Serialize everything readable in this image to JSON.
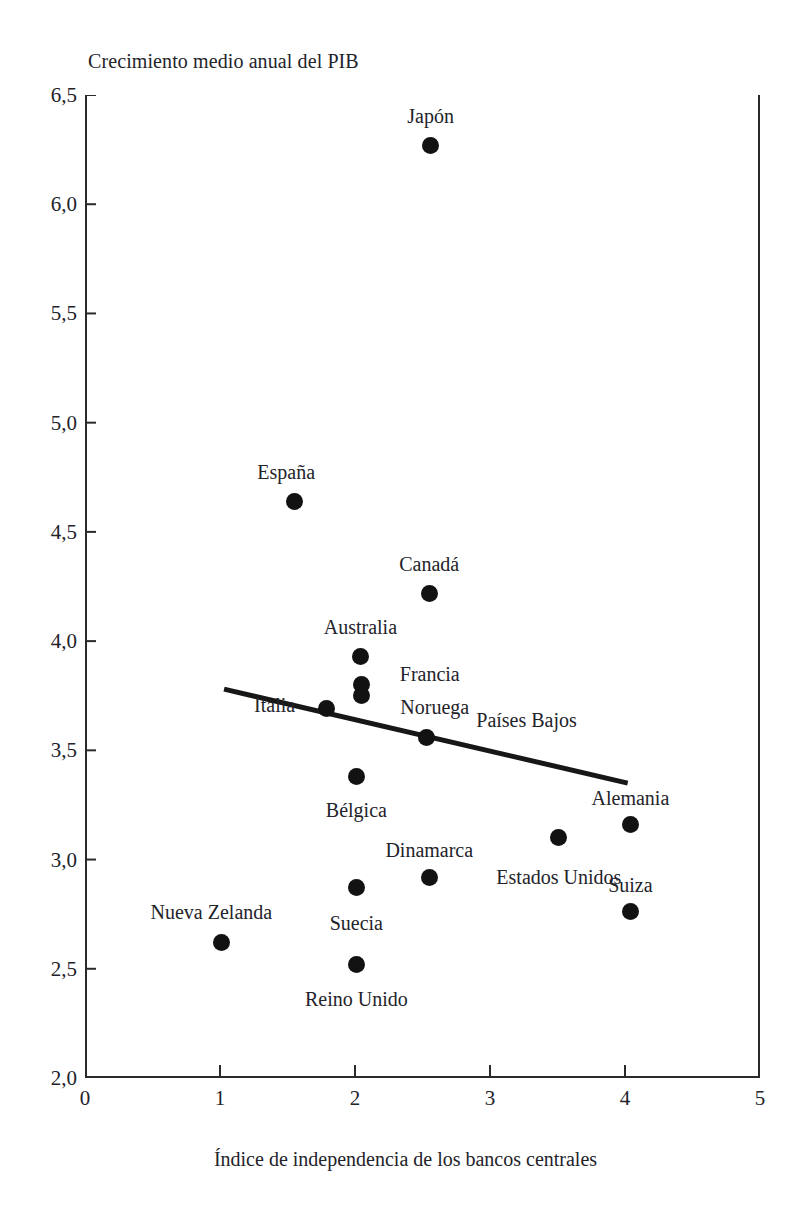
{
  "chart_data": {
    "type": "scatter",
    "title": "",
    "ylabel": "Crecimiento medio anual del PIB",
    "xlabel": "Índice de independencia de los bancos centrales",
    "xlim": [
      0,
      5
    ],
    "ylim": [
      2.0,
      6.5
    ],
    "grid": false,
    "legend": "none",
    "xticks": [
      "0",
      "1",
      "2",
      "3",
      "4",
      "5"
    ],
    "xtick_values": [
      0,
      1,
      2,
      3,
      4,
      5
    ],
    "yticks": [
      "2,0",
      "2,5",
      "3,0",
      "3,5",
      "4,0",
      "4,5",
      "5,0",
      "5,5",
      "6,0",
      "6,5"
    ],
    "ytick_values": [
      2.0,
      2.5,
      3.0,
      3.5,
      4.0,
      4.5,
      5.0,
      5.5,
      6.0,
      6.5
    ],
    "points": [
      {
        "label": "Japón",
        "x": 2.56,
        "y": 6.27,
        "label_dx": 0,
        "label_dy": -30
      },
      {
        "label": "España",
        "x": 1.55,
        "y": 4.64,
        "label_dx": -8,
        "label_dy": -30
      },
      {
        "label": "Canadá",
        "x": 2.55,
        "y": 4.22,
        "label_dx": 0,
        "label_dy": -30
      },
      {
        "label": "Australia",
        "x": 2.04,
        "y": 3.93,
        "label_dx": 0,
        "label_dy": -30
      },
      {
        "label": "Francia",
        "x": 2.05,
        "y": 3.8,
        "label_dx": 68,
        "label_dy": -12
      },
      {
        "label": "Noruega",
        "x": 2.05,
        "y": 3.75,
        "label_dx": 73,
        "label_dy": 10
      },
      {
        "label": "Italia",
        "x": 1.79,
        "y": 3.69,
        "label_dx": -52,
        "label_dy": -5
      },
      {
        "label": "Países Bajos",
        "x": 2.53,
        "y": 3.56,
        "label_dx": 100,
        "label_dy": -18
      },
      {
        "label": "Bélgica",
        "x": 2.01,
        "y": 3.38,
        "label_dx": 0,
        "label_dy": 32
      },
      {
        "label": "Alemania",
        "x": 4.04,
        "y": 3.16,
        "label_dx": 0,
        "label_dy": -28
      },
      {
        "label": "Estados Unidos",
        "x": 3.51,
        "y": 3.1,
        "label_dx": 0,
        "label_dy": 38
      },
      {
        "label": "Dinamarca",
        "x": 2.55,
        "y": 2.92,
        "label_dx": 0,
        "label_dy": -28
      },
      {
        "label": "Suecia",
        "x": 2.01,
        "y": 2.87,
        "label_dx": 0,
        "label_dy": 34
      },
      {
        "label": "Suiza",
        "x": 4.04,
        "y": 2.76,
        "label_dx": 0,
        "label_dy": -28
      },
      {
        "label": "Nueva Zelanda",
        "x": 1.01,
        "y": 2.62,
        "label_dx": -10,
        "label_dy": -32
      },
      {
        "label": "Reino Unido",
        "x": 2.01,
        "y": 2.52,
        "label_dx": 0,
        "label_dy": 34
      }
    ],
    "trend_line": {
      "x_start": 1.03,
      "y_start": 3.78,
      "x_end": 4.02,
      "y_end": 3.35
    },
    "colors": {
      "point": "#121212",
      "axis": "#2a2a2a",
      "trend": "#171717",
      "text": "#23232a",
      "background": "#ffffff"
    }
  }
}
